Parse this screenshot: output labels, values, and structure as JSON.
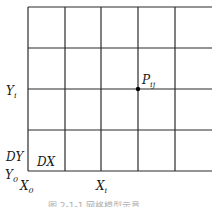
{
  "diagram": {
    "type": "grid",
    "grid": {
      "vertical_lines_x": [
        28,
        65,
        101,
        138,
        175
      ],
      "horizontal_lines_y": [
        7,
        48,
        89,
        130,
        171
      ],
      "right_edge_x": 212,
      "line_color": "#2b2b2b"
    },
    "point": {
      "label_main": "P",
      "label_sub": "ij",
      "x": 138,
      "y": 89,
      "color": "#000000"
    },
    "labels": {
      "yi_main": "Y",
      "yi_sub": "i",
      "dy": "DY",
      "dx": "DX",
      "y0_main": "Y",
      "y0_sub": "0",
      "x0_main": "X",
      "x0_sub": "0",
      "xi_main": "X",
      "xi_sub": "i"
    },
    "caption": "图 2-1-1  网格模型示意"
  }
}
